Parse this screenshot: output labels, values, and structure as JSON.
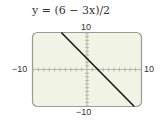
{
  "chart_data": {
    "type": "line",
    "title": "y = (6 − 3x)/2",
    "equation": "y = (6 - 3x)/2",
    "xlabel": "",
    "ylabel": "",
    "xlim": [
      -10,
      10
    ],
    "ylim": [
      -10,
      10
    ],
    "tick_labels": {
      "x_min": "−10",
      "x_max": "10",
      "y_min": "−10",
      "y_max": "10"
    },
    "tick_spacing": 1,
    "grid": false,
    "series": [
      {
        "name": "y = (6 - 3x)/2",
        "x": [
          -4.67,
          8.67
        ],
        "y": [
          10,
          -10
        ],
        "color": "#1a1a1a"
      }
    ],
    "background": "#f1f3e4",
    "frame_color": "#9a9a9a"
  }
}
